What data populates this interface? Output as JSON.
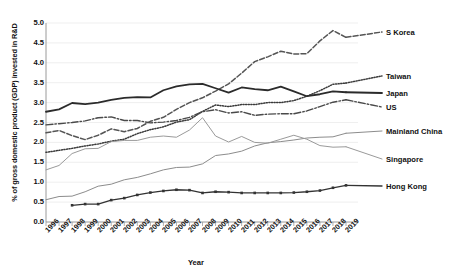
{
  "chart_data": {
    "type": "line",
    "title": "",
    "xlabel": "Year",
    "ylabel": "% of gross domestic product (GDP) invested in R&D",
    "ylim": [
      0.0,
      5.0
    ],
    "ytick_labels": [
      "0.0",
      "0.5",
      "1.0",
      "1.5",
      "2.0",
      "2.5",
      "3.0",
      "3.5",
      "4.0",
      "4.5",
      "5.0"
    ],
    "ytick_values": [
      0.0,
      0.5,
      1.0,
      1.5,
      2.0,
      2.5,
      3.0,
      3.5,
      4.0,
      4.5,
      5.0
    ],
    "grid": true,
    "legend_position": "right",
    "categories": [
      "1996",
      "1997",
      "1998",
      "1999",
      "2000",
      "2001",
      "2002",
      "2003",
      "2004",
      "2005",
      "2006",
      "2007",
      "2008",
      "2009",
      "2010",
      "2011",
      "2012",
      "2013",
      "2014",
      "2015",
      "2016",
      "2017",
      "2018",
      "2019"
    ],
    "x": [
      1996,
      1997,
      1998,
      1999,
      2000,
      2001,
      2002,
      2003,
      2004,
      2005,
      2006,
      2007,
      2008,
      2009,
      2010,
      2011,
      2012,
      2013,
      2014,
      2015,
      2016,
      2017,
      2018,
      2019
    ],
    "series": [
      {
        "name": "S Korea",
        "style": "dashed",
        "color": "#555555",
        "values": [
          2.24,
          2.3,
          2.17,
          2.07,
          2.18,
          2.34,
          2.27,
          2.35,
          2.53,
          2.63,
          2.83,
          3.0,
          3.12,
          3.29,
          3.47,
          3.74,
          4.03,
          4.15,
          4.29,
          4.22,
          4.23,
          4.55,
          4.81,
          4.64
        ]
      },
      {
        "name": "Taiwan",
        "style": "dotted",
        "color": "#3a3a3a",
        "values": [
          1.75,
          1.8,
          1.85,
          1.91,
          1.96,
          2.03,
          2.08,
          2.22,
          2.32,
          2.39,
          2.51,
          2.57,
          2.78,
          2.94,
          2.9,
          2.95,
          2.95,
          3.0,
          3.0,
          3.05,
          3.16,
          3.3,
          3.46,
          3.49
        ]
      },
      {
        "name": "Japan",
        "style": "solid",
        "color": "#2b2b2b",
        "values": [
          2.77,
          2.83,
          2.99,
          2.96,
          3.0,
          3.07,
          3.12,
          3.14,
          3.13,
          3.31,
          3.41,
          3.46,
          3.47,
          3.36,
          3.25,
          3.38,
          3.34,
          3.31,
          3.4,
          3.28,
          3.16,
          3.21,
          3.28,
          3.26
        ]
      },
      {
        "name": "US",
        "style": "dashdot",
        "color": "#4a4a4a",
        "values": [
          2.44,
          2.47,
          2.5,
          2.54,
          2.62,
          2.64,
          2.55,
          2.55,
          2.49,
          2.51,
          2.55,
          2.63,
          2.77,
          2.82,
          2.74,
          2.77,
          2.68,
          2.71,
          2.72,
          2.72,
          2.79,
          2.9,
          3.01,
          3.07
        ]
      },
      {
        "name": "Mainland China",
        "style": "solid-thin",
        "color": "#8c8c8c",
        "values": [
          0.56,
          0.64,
          0.65,
          0.76,
          0.9,
          0.95,
          1.06,
          1.12,
          1.21,
          1.31,
          1.37,
          1.38,
          1.46,
          1.67,
          1.71,
          1.78,
          1.91,
          1.99,
          2.02,
          2.06,
          2.11,
          2.13,
          2.14,
          2.23
        ]
      },
      {
        "name": "Singapore",
        "style": "solid-thin",
        "color": "#9a9a9a",
        "values": [
          1.31,
          1.42,
          1.72,
          1.84,
          1.85,
          2.02,
          2.05,
          2.05,
          2.13,
          2.16,
          2.13,
          2.31,
          2.62,
          2.16,
          2.01,
          2.15,
          2.0,
          1.98,
          2.08,
          2.18,
          2.08,
          1.92,
          1.88,
          1.89
        ]
      },
      {
        "name": "Hong Kong",
        "style": "solid-marker",
        "color": "#333333",
        "values": [
          null,
          null,
          0.42,
          0.45,
          0.45,
          0.55,
          0.6,
          0.68,
          0.74,
          0.78,
          0.81,
          0.8,
          0.73,
          0.76,
          0.75,
          0.73,
          0.73,
          0.73,
          0.73,
          0.74,
          0.76,
          0.79,
          0.86,
          0.92
        ]
      }
    ]
  },
  "axes": {
    "y_title": "% of gross domestic product (GDP) invested in R&D",
    "x_title": "Year"
  },
  "legend": {
    "items": [
      {
        "label": "S Korea"
      },
      {
        "label": "Taiwan"
      },
      {
        "label": "Japan"
      },
      {
        "label": "US"
      },
      {
        "label": "Mainland China"
      },
      {
        "label": "Singapore"
      },
      {
        "label": "Hong Kong"
      }
    ]
  }
}
